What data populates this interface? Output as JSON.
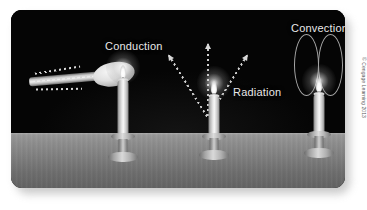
{
  "figure": {
    "credit": "© Cengage Learning 2013",
    "panel_background": "#050505",
    "floor_color": "#8e8e8e",
    "label_color": "#e8e8e8"
  },
  "labels": {
    "conduction": "Conduction",
    "radiation": "Radiation",
    "convection": "Convection"
  },
  "scenes": [
    {
      "id": "conduction",
      "label": "Conduction",
      "description": "A metal spoon held over a candle flame with dashed arrows showing heat traveling along the handle"
    },
    {
      "id": "radiation",
      "label": "Radiation",
      "description": "A candle flame emitting three dashed arrows radiating outward and upward"
    },
    {
      "id": "convection",
      "label": "Convection",
      "description": "A candle flame with two vertical circulation loops of rising heated air above it"
    }
  ],
  "candles": [
    {
      "id": "candle-conduction",
      "name": "candle-1"
    },
    {
      "id": "candle-radiation",
      "name": "candle-2"
    },
    {
      "id": "candle-convection",
      "name": "candle-3"
    }
  ]
}
